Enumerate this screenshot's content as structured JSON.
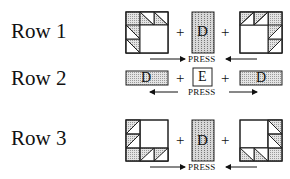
{
  "rows": [
    {
      "label": "Row 1",
      "center_letter": "D",
      "press_label": "PRESS",
      "press_direction": "toward-center",
      "plus": "+"
    },
    {
      "label": "Row 2",
      "left_letter": "D",
      "center_letter": "E",
      "right_letter": "D",
      "press_label": "PRESS",
      "press_direction": "away-from-center",
      "plus": "+"
    },
    {
      "label": "Row 3",
      "center_letter": "D",
      "press_label": "PRESS",
      "press_direction": "toward-center",
      "plus": "+"
    }
  ],
  "colors": {
    "line": "#222222",
    "fill_dots": "#bdbdbd",
    "background": "#ffffff"
  }
}
